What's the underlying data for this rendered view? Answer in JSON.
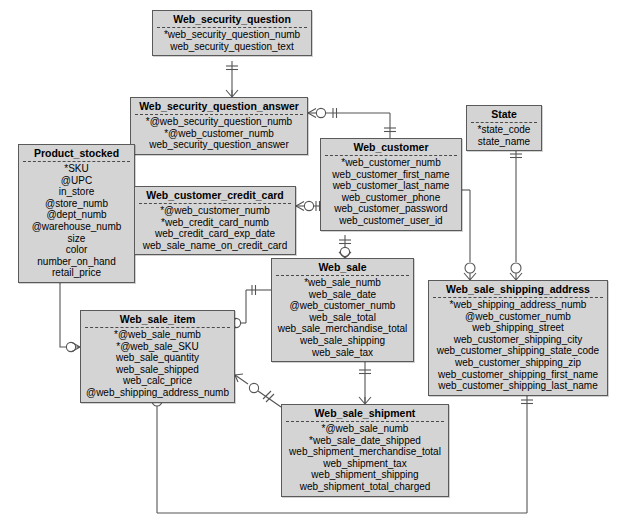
{
  "diagram": {
    "notation": "crow's-foot (IE) ERD",
    "style": {
      "entity_fill": "#d4d4d4",
      "entity_border": "#5a5a5a",
      "line_color": "#555555",
      "background": "#ffffff"
    },
    "legend_symbols": {
      "primary_key_marker": "*",
      "foreign_key_marker": "@",
      "one_mandatory": "||",
      "zero_or_one": "o|",
      "many_optional": "o<"
    }
  },
  "entities": [
    {
      "id": "web_security_question",
      "name": "Web_security_question",
      "x": 152,
      "y": 10,
      "w": 160,
      "attributes": [
        "*web_security_question_numb",
        "web_security_question_text"
      ]
    },
    {
      "id": "web_security_question_answer",
      "name": "Web_security_question_answer",
      "x": 130,
      "y": 97,
      "w": 178,
      "attributes": [
        "*@web_security_question_numb",
        "*@web_customer_numb",
        "web_security_question_answer"
      ]
    },
    {
      "id": "state",
      "name": "State",
      "x": 466,
      "y": 105,
      "w": 76,
      "attributes": [
        "*state_code",
        "state_name"
      ]
    },
    {
      "id": "web_customer",
      "name": "Web_customer",
      "x": 320,
      "y": 138,
      "w": 142,
      "attributes": [
        "*web_customer_numb",
        "web_customer_first_name",
        "web_customer_last_name",
        "web_customer_phone",
        "web_customer_password",
        "web_customer_user_id"
      ]
    },
    {
      "id": "product_stocked",
      "name": "Product_stocked",
      "x": 18,
      "y": 144,
      "w": 117,
      "attributes": [
        "*SKU",
        "@UPC",
        "in_store",
        "@store_numb",
        "@dept_numb",
        "@warehouse_numb",
        "size",
        "color",
        "number_on_hand",
        "retail_price"
      ]
    },
    {
      "id": "web_customer_credit_card",
      "name": "Web_customer_credit_card",
      "x": 134,
      "y": 186,
      "w": 162,
      "attributes": [
        "*@web_customer_numb",
        "*web_credit_card_numb",
        "web_credit_card_exp_date",
        "web_sale_name_on_credit_card"
      ]
    },
    {
      "id": "web_sale",
      "name": "Web_sale",
      "x": 271,
      "y": 258,
      "w": 143,
      "attributes": [
        "*web_sale_numb",
        "web_sale_date",
        "@web_customer_numb",
        "web_sale_total",
        "web_sale_merchandise_total",
        "web_sale_shipping",
        "web_sale_tax"
      ]
    },
    {
      "id": "web_sale_shipping_address",
      "name": "Web_sale_shipping_address",
      "x": 428,
      "y": 280,
      "w": 180,
      "attributes": [
        "*web_shipping_address_numb",
        "@web_customer_numb",
        "web_shipping_street",
        "web_customer_shipping_city",
        "web_customer_shipping_state_code",
        "web_customer_shipping_zip",
        "web_customer_shipping_first_name",
        "web_customer_shipping_last_name"
      ]
    },
    {
      "id": "web_sale_item",
      "name": "Web_sale_item",
      "x": 80,
      "y": 310,
      "w": 155,
      "attributes": [
        "*@web_sale_numb",
        "*@web_sale_SKU",
        "web_sale_quantity",
        "web_sale_shipped",
        "web_calc_price",
        "@web_shipping_address_numb"
      ]
    },
    {
      "id": "web_sale_shipment",
      "name": "Web_sale_shipment",
      "x": 281,
      "y": 404,
      "w": 168,
      "attributes": [
        "*@web_sale_numb",
        "*web_sale_date_shipped",
        "web_shipment_merchandise_total",
        "web_shipment_tax",
        "web_shipment_shipping",
        "web_shipment_total_charged"
      ]
    }
  ],
  "relationships": [
    {
      "from": "web_security_question",
      "to": "web_security_question_answer",
      "from_card": "one-mandatory",
      "to_card": "zero-or-many"
    },
    {
      "from": "web_customer",
      "to": "web_security_question_answer",
      "from_card": "one-mandatory",
      "to_card": "zero-or-many"
    },
    {
      "from": "web_customer",
      "to": "web_customer_credit_card",
      "from_card": "one-mandatory",
      "to_card": "zero-or-many"
    },
    {
      "from": "web_customer",
      "to": "web_sale",
      "from_card": "one-mandatory",
      "to_card": "zero-or-many"
    },
    {
      "from": "web_customer",
      "to": "web_sale_shipping_address",
      "from_card": "one-mandatory",
      "to_card": "zero-or-many"
    },
    {
      "from": "state",
      "to": "web_sale_shipping_address",
      "from_card": "one-mandatory",
      "to_card": "zero-or-many"
    },
    {
      "from": "web_sale",
      "to": "web_sale_item",
      "from_card": "one-mandatory",
      "to_card": "zero-or-many"
    },
    {
      "from": "web_sale",
      "to": "web_sale_shipment",
      "from_card": "one-mandatory",
      "to_card": "zero-or-many"
    },
    {
      "from": "product_stocked",
      "to": "web_sale_item",
      "from_card": "one-mandatory",
      "to_card": "zero-or-many"
    },
    {
      "from": "web_sale_shipping_address",
      "to": "web_sale_item",
      "from_card": "one-mandatory",
      "to_card": "zero-or-many"
    },
    {
      "from": "web_sale_shipment",
      "to": "web_sale_item",
      "from_card": "one-mandatory",
      "to_card": "zero-or-many"
    }
  ]
}
